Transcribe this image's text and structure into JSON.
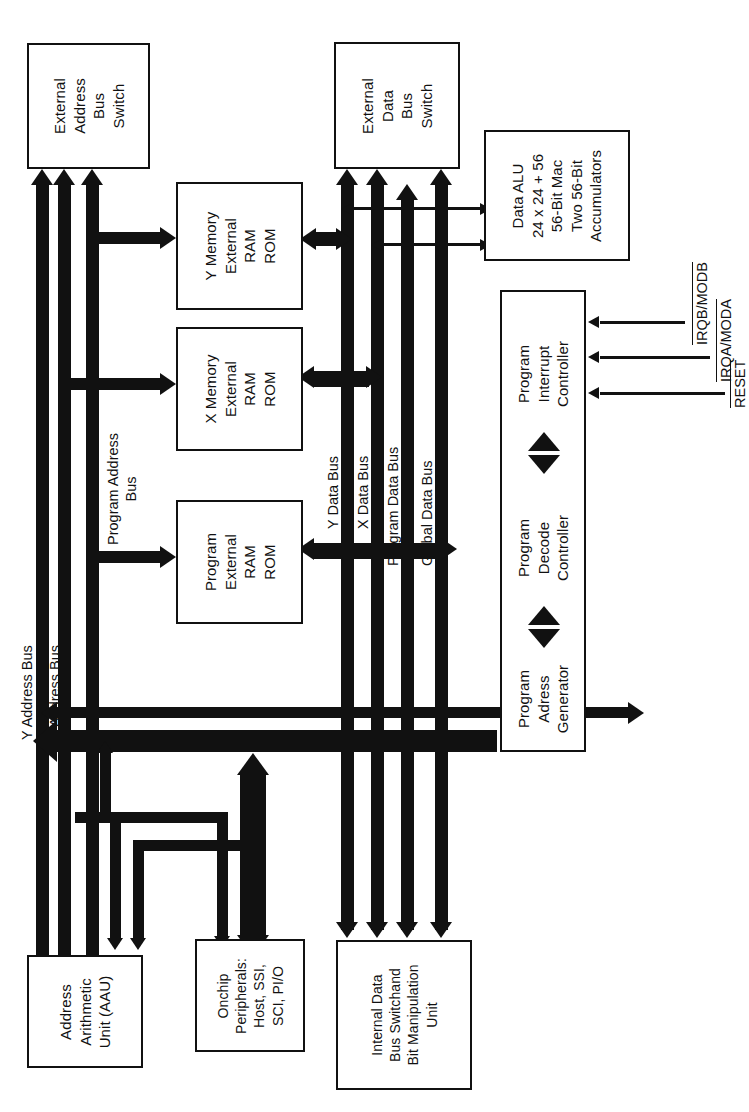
{
  "diagram": {
    "orientation": "rotated-90-ccw",
    "line_color": "#111111",
    "background": "#ffffff"
  },
  "blocks": {
    "external_address_bus_switch": {
      "lines": [
        "External",
        "Address",
        "Bus",
        "Switch"
      ]
    },
    "external_data_bus_switch": {
      "lines": [
        "External",
        "Data",
        "Bus",
        "Switch"
      ]
    },
    "y_memory": {
      "lines": [
        "Y Memory",
        "External",
        "RAM",
        "ROM"
      ]
    },
    "x_memory": {
      "lines": [
        "X Memory",
        "External",
        "RAM",
        "ROM"
      ]
    },
    "program_memory": {
      "lines": [
        "Program",
        "External",
        "RAM",
        "ROM"
      ]
    },
    "data_alu": {
      "lines": [
        "Data ALU",
        "24 x 24 + 56",
        "56-Bit Mac",
        "Two 56-Bit",
        "Accumulators"
      ]
    },
    "program_interrupt_controller": {
      "lines": [
        "Program",
        "Interrupt",
        "Controller"
      ]
    },
    "program_decode_controller": {
      "lines": [
        "Program",
        "Decode",
        "Controller"
      ]
    },
    "program_address_generator": {
      "lines": [
        "Program",
        "Adress",
        "Generator"
      ]
    },
    "address_arithmetic_unit": {
      "lines": [
        "Address",
        "Arithmetic",
        "Unit (AAU)"
      ]
    },
    "onchip_peripherals": {
      "lines": [
        "Onchip",
        "Peripherals:",
        "Host, SSI,",
        "SCI, PI/O"
      ]
    },
    "internal_data_bus_switch": {
      "lines": [
        "Internal Data",
        "Bus Switchand",
        "Bit Manipulation",
        "Unit"
      ]
    }
  },
  "bus_labels": {
    "y_address_bus": {
      "lines": [
        "Y Address Bus"
      ]
    },
    "x_address_bus": {
      "lines": [
        "X Address Bus"
      ]
    },
    "program_address_bus": {
      "lines": [
        "Program Address",
        "Bus"
      ]
    },
    "y_data_bus": {
      "lines": [
        "Y Data Bus"
      ]
    },
    "x_data_bus": {
      "lines": [
        "X Data Bus"
      ]
    },
    "program_data_bus": {
      "lines": [
        "Program Data Bus"
      ]
    },
    "global_data_bus": {
      "lines": [
        "Global Data Bus"
      ]
    }
  },
  "signals": [
    {
      "name": "irqb-modb",
      "label": "IRQB/MODB",
      "active_low": true
    },
    {
      "name": "irqa-moda",
      "label": "IRQA/MODA",
      "active_low": true
    },
    {
      "name": "reset",
      "label": "RESET",
      "active_low": true
    }
  ]
}
